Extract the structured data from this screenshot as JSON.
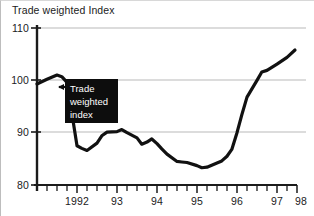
{
  "chart_data": {
    "type": "line",
    "title": "Trade weighted Index",
    "xlabel": "",
    "ylabel": "",
    "ylim": [
      80,
      110
    ],
    "xlim": [
      1991.5,
      1998.0
    ],
    "yticks": [
      80,
      90,
      100,
      110
    ],
    "ytick_labels": [
      "80",
      "90",
      "100",
      "110"
    ],
    "xticks": [
      1992,
      1993,
      1994,
      1995,
      1996,
      1997,
      1998
    ],
    "xtick_labels": [
      "1992",
      "93",
      "94",
      "95",
      "96",
      "97",
      "98"
    ],
    "minor_tick_interval": 0.25,
    "grid": "horizontal",
    "grid_color": "#b9b9b9",
    "line_color": "#111111",
    "line_width": 3.2,
    "legend": "none",
    "annotation": {
      "text_lines": [
        "Trade",
        "weighted",
        "index"
      ],
      "style": "black box with white text and left-pointing arrow",
      "points_to_x": 1992.45,
      "points_to_y": 95.0
    },
    "series": [
      {
        "name": "Trade weighted index",
        "x": [
          1991.5,
          1991.75,
          1992.0,
          1992.12,
          1992.25,
          1992.5,
          1992.62,
          1992.75,
          1993.0,
          1993.12,
          1993.25,
          1993.5,
          1993.62,
          1993.75,
          1994.0,
          1994.12,
          1994.25,
          1994.37,
          1994.5,
          1994.62,
          1994.75,
          1995.0,
          1995.12,
          1995.25,
          1995.5,
          1995.62,
          1995.75,
          1996.0,
          1996.12,
          1996.25,
          1996.37,
          1996.5,
          1996.62,
          1996.75,
          1997.0,
          1997.12,
          1997.25,
          1997.5,
          1997.75,
          1997.95
        ],
        "y": [
          99.3,
          100.2,
          101.0,
          100.7,
          99.6,
          87.5,
          87.0,
          86.6,
          88.0,
          89.4,
          90.1,
          90.2,
          90.6,
          90.0,
          89.0,
          87.8,
          88.2,
          88.8,
          87.9,
          86.9,
          85.9,
          84.5,
          84.4,
          84.3,
          83.7,
          83.3,
          83.4,
          84.2,
          84.6,
          85.5,
          86.8,
          90.0,
          93.4,
          96.8,
          100.0,
          101.6,
          101.9,
          103.1,
          104.4,
          105.8
        ]
      }
    ]
  },
  "axis": {
    "y_labels": [
      "110",
      "100",
      "90",
      "80"
    ],
    "x_labels": [
      "1992",
      "93",
      "94",
      "95",
      "96",
      "97",
      "98"
    ]
  },
  "annotation": {
    "line1": "Trade",
    "line2": "weighted",
    "line3": "index"
  },
  "title": {
    "text": "Trade weighted Index"
  }
}
